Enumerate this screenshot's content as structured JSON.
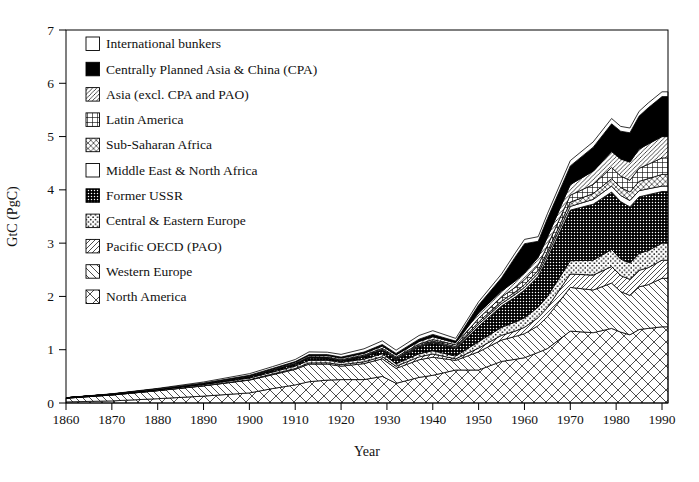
{
  "figure": {
    "kind": "stacked-area-figure",
    "background_color": "#ffffff",
    "frame_color": "#000000",
    "text_color": "#111111"
  },
  "chart_data": {
    "type": "area",
    "stacked": true,
    "title": "",
    "xlabel": "Year",
    "ylabel": "GtC (PgC)",
    "xlim": [
      1860,
      1991.3
    ],
    "ylim": [
      0,
      7
    ],
    "x_ticks": [
      1860,
      1870,
      1880,
      1890,
      1900,
      1910,
      1920,
      1930,
      1940,
      1950,
      1960,
      1970,
      1980,
      1990
    ],
    "y_ticks": [
      0,
      1,
      2,
      3,
      4,
      5,
      6,
      7
    ],
    "grid": false,
    "legend_position": "inside top-left, no border, top-to-bottom order is reverse of stacking",
    "x": [
      1860,
      1870,
      1880,
      1890,
      1900,
      1905,
      1910,
      1913,
      1917,
      1920,
      1925,
      1929,
      1932,
      1937,
      1940,
      1945,
      1950,
      1955,
      1958,
      1960,
      1963,
      1965,
      1970,
      1975,
      1979,
      1981,
      1983,
      1985,
      1987,
      1990
    ],
    "series": [
      {
        "key": "na",
        "name": "North America",
        "pattern": "diamond-lattice",
        "values": [
          0.02,
          0.04,
          0.08,
          0.13,
          0.19,
          0.27,
          0.34,
          0.4,
          0.43,
          0.44,
          0.44,
          0.5,
          0.37,
          0.48,
          0.52,
          0.62,
          0.62,
          0.78,
          0.82,
          0.85,
          0.95,
          1.02,
          1.35,
          1.32,
          1.4,
          1.33,
          1.28,
          1.38,
          1.4,
          1.43
        ]
      },
      {
        "key": "we",
        "name": "Western Europe",
        "pattern": "backslash-hatch",
        "values": [
          0.07,
          0.11,
          0.15,
          0.19,
          0.24,
          0.26,
          0.29,
          0.33,
          0.3,
          0.25,
          0.3,
          0.33,
          0.28,
          0.33,
          0.34,
          0.18,
          0.34,
          0.4,
          0.43,
          0.45,
          0.5,
          0.6,
          0.82,
          0.8,
          0.85,
          0.76,
          0.74,
          0.8,
          0.82,
          0.91
        ]
      },
      {
        "key": "pao",
        "name": "Pacific OECD (PAO)",
        "pattern": "slash-hatch",
        "values": [
          0.0,
          0.001,
          0.002,
          0.004,
          0.008,
          0.012,
          0.018,
          0.022,
          0.025,
          0.028,
          0.033,
          0.04,
          0.04,
          0.055,
          0.06,
          0.03,
          0.07,
          0.09,
          0.1,
          0.12,
          0.15,
          0.17,
          0.25,
          0.28,
          0.31,
          0.3,
          0.3,
          0.31,
          0.32,
          0.34
        ]
      },
      {
        "key": "cee",
        "name": "Central & Eastern Europe",
        "pattern": "sparse-dots",
        "values": [
          0.005,
          0.009,
          0.015,
          0.022,
          0.032,
          0.038,
          0.045,
          0.05,
          0.048,
          0.045,
          0.05,
          0.055,
          0.048,
          0.058,
          0.062,
          0.05,
          0.12,
          0.15,
          0.17,
          0.18,
          0.2,
          0.21,
          0.25,
          0.28,
          0.32,
          0.31,
          0.31,
          0.32,
          0.32,
          0.32
        ]
      },
      {
        "key": "ussr",
        "name": "Former USSR",
        "pattern": "dense-dark-dots",
        "values": [
          0.002,
          0.004,
          0.008,
          0.013,
          0.022,
          0.028,
          0.035,
          0.045,
          0.035,
          0.02,
          0.04,
          0.06,
          0.08,
          0.13,
          0.15,
          0.14,
          0.29,
          0.4,
          0.47,
          0.52,
          0.58,
          0.72,
          0.95,
          1.05,
          1.08,
          1.08,
          1.05,
          1.06,
          1.05,
          0.97
        ]
      },
      {
        "key": "me",
        "name": "Middle East & North Africa",
        "pattern": "white",
        "values": [
          0.0,
          0.0,
          0.001,
          0.001,
          0.002,
          0.003,
          0.004,
          0.004,
          0.005,
          0.006,
          0.007,
          0.008,
          0.009,
          0.01,
          0.012,
          0.015,
          0.04,
          0.045,
          0.048,
          0.05,
          0.055,
          0.06,
          0.07,
          0.09,
          0.11,
          0.115,
          0.12,
          0.115,
          0.11,
          0.1
        ]
      },
      {
        "key": "ssa",
        "name": "Sub-Saharan Africa",
        "pattern": "diagonal-cross",
        "values": [
          0.0,
          0.0,
          0.001,
          0.002,
          0.003,
          0.004,
          0.005,
          0.006,
          0.007,
          0.008,
          0.01,
          0.012,
          0.013,
          0.018,
          0.02,
          0.025,
          0.04,
          0.045,
          0.048,
          0.05,
          0.055,
          0.06,
          0.08,
          0.11,
          0.14,
          0.15,
          0.16,
          0.175,
          0.19,
          0.22
        ]
      },
      {
        "key": "la",
        "name": "Latin America",
        "pattern": "square-grid",
        "values": [
          0.0,
          0.001,
          0.002,
          0.004,
          0.006,
          0.008,
          0.01,
          0.012,
          0.013,
          0.015,
          0.018,
          0.022,
          0.021,
          0.026,
          0.028,
          0.032,
          0.07,
          0.08,
          0.085,
          0.09,
          0.1,
          0.11,
          0.13,
          0.17,
          0.21,
          0.215,
          0.22,
          0.245,
          0.27,
          0.31
        ]
      },
      {
        "key": "asia",
        "name": "Asia (excl. CPA and PAO)",
        "pattern": "thin-slash-hatch",
        "values": [
          0.001,
          0.002,
          0.004,
          0.007,
          0.012,
          0.016,
          0.02,
          0.025,
          0.028,
          0.03,
          0.035,
          0.04,
          0.042,
          0.048,
          0.05,
          0.04,
          0.1,
          0.11,
          0.12,
          0.13,
          0.145,
          0.16,
          0.2,
          0.25,
          0.3,
          0.32,
          0.34,
          0.36,
          0.38,
          0.4
        ]
      },
      {
        "key": "cpa",
        "name": "Centrally Planned Asia & China (CPA)",
        "pattern": "solid-black",
        "values": [
          0.0,
          0.0,
          0.001,
          0.002,
          0.005,
          0.008,
          0.01,
          0.015,
          0.018,
          0.02,
          0.025,
          0.03,
          0.028,
          0.042,
          0.045,
          0.03,
          0.15,
          0.25,
          0.45,
          0.55,
          0.3,
          0.35,
          0.35,
          0.45,
          0.52,
          0.52,
          0.55,
          0.62,
          0.68,
          0.75
        ]
      },
      {
        "key": "bunk",
        "name": "International bunkers",
        "pattern": "white",
        "values": [
          0.002,
          0.005,
          0.01,
          0.02,
          0.03,
          0.035,
          0.04,
          0.05,
          0.045,
          0.05,
          0.06,
          0.07,
          0.06,
          0.07,
          0.07,
          0.05,
          0.06,
          0.07,
          0.075,
          0.08,
          0.085,
          0.09,
          0.1,
          0.1,
          0.1,
          0.09,
          0.09,
          0.09,
          0.09,
          0.09
        ]
      }
    ],
    "legend_top_to_bottom": [
      "bunk",
      "cpa",
      "asia",
      "la",
      "ssa",
      "me",
      "ussr",
      "cee",
      "pao",
      "we",
      "na"
    ]
  }
}
